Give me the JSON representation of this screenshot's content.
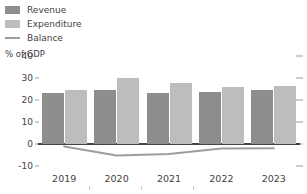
{
  "chart_data": {
    "type": "bar",
    "title": "",
    "subtitle": "",
    "xlabel": "",
    "ylabel": "% of GDP",
    "categories": [
      "2019",
      "2020",
      "2021",
      "2022",
      "2023"
    ],
    "ylim": [
      -10,
      40
    ],
    "yticks": [
      40,
      30,
      20,
      10,
      0,
      -10
    ],
    "ytick_labels": [
      "40",
      "30",
      "20",
      "10",
      "0",
      "-10"
    ],
    "grid": false,
    "legend_position": "top-left",
    "series": [
      {
        "name": "Revenue",
        "type": "bar",
        "color": "#8d8d8d",
        "values": [
          23.3,
          24.6,
          23.3,
          23.6,
          24.4
        ]
      },
      {
        "name": "Expenditure",
        "type": "bar",
        "color": "#bdbdbd",
        "values": [
          24.4,
          29.8,
          27.8,
          25.7,
          26.3
        ]
      },
      {
        "name": "Balance",
        "type": "line",
        "color": "#9d9d9d",
        "values": [
          -1.1,
          -5.2,
          -4.5,
          -2.1,
          -1.9
        ]
      }
    ]
  },
  "legend": {
    "items": [
      {
        "label": "Revenue",
        "swatch": "revenue"
      },
      {
        "label": "Expenditure",
        "swatch": "expenditure"
      },
      {
        "label": "Balance",
        "swatch": "line"
      }
    ]
  },
  "axis": {
    "y_title": "% of GDP"
  }
}
